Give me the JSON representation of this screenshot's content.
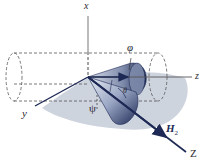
{
  "figure": {
    "axes": {
      "x": "x",
      "y": "y",
      "z": "z",
      "Z": "Z"
    },
    "vector": {
      "name": "H",
      "subscript": "2"
    },
    "angles": {
      "phi": "φ",
      "theta": "θ",
      "psi": "ψ"
    },
    "colors": {
      "cone_dark": "#1e2a55",
      "cone_light": "#c9d0e0",
      "shadow": "#c5ccd8",
      "axis": "#2a2a33",
      "dashed": "#555555"
    }
  }
}
